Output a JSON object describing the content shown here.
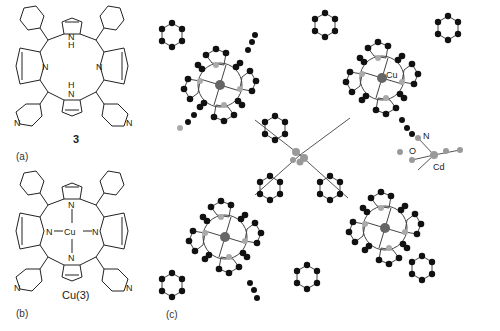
{
  "figure": {
    "panels": [
      {
        "id": "a",
        "label": "(a)",
        "compound_label": "3",
        "description": "5,10-diphenyl-15,20-di(4-pyridyl)porphyrin free base structural formula",
        "atoms_labeled": [
          "N",
          "NH",
          "N",
          "H",
          "N",
          "N"
        ]
      },
      {
        "id": "b",
        "label": "(b)",
        "compound_label": "Cu(3)",
        "description": "Copper(II) porphyrin complex structural formula",
        "metal": "Cu",
        "atoms_labeled": [
          "N",
          "N",
          "Cu",
          "N",
          "N",
          "N",
          "N"
        ]
      },
      {
        "id": "c",
        "label": "(c)",
        "description": "Ball-and-stick crystal structure showing four Cu-porphyrin units coordinated to a central Cd node",
        "atom_labels": [
          "Cu",
          "N",
          "O",
          "Cd"
        ]
      }
    ]
  },
  "labels": {
    "a_panel": "(a)",
    "a_compound": "3",
    "b_panel": "(b)",
    "b_compound": "Cu(3)",
    "c_panel": "(c)",
    "atom_N": "N",
    "atom_NH": "NH",
    "atom_H": "H",
    "atom_Cu": "Cu",
    "atom_Cd": "Cd",
    "atom_O": "O"
  },
  "colors": {
    "bond": "#222222",
    "carbon_atom": "#111111",
    "nitrogen_atom": "#a8a8a8",
    "metal_atom": "#666666"
  }
}
